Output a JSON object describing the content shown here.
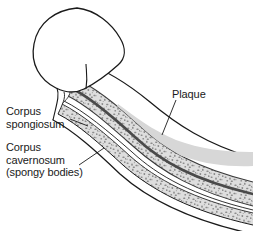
{
  "figure": {
    "background_color": "#ffffff"
  },
  "labels": {
    "corpus_spongiosum": "Corpus\nspongiosum",
    "corpus_cavernosum": "Corpus\ncavernosum\n(spongy bodies)",
    "plaque": "Plaque"
  },
  "caption": {
    "text": ""
  },
  "colors": {
    "outline": "#1a1a1a",
    "tissue_fill": "#d8d8d8",
    "speckle": "#8a8a8a",
    "septum": "#4a4a4a",
    "plaque_fill": "#d9d9d9",
    "glans_fill": "#ffffff",
    "leader_line": "#1a1a1a",
    "text": "#1a1a1a"
  },
  "anatomy": {
    "parts": [
      "glans",
      "corpus cavernosum",
      "corpus spongiosum",
      "tunica albuginea",
      "plaque"
    ]
  }
}
